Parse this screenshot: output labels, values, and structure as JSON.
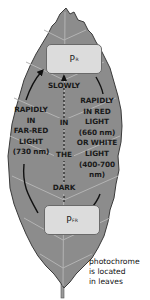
{
  "diagram": {
    "type": "phytochrome-cycle",
    "colors": {
      "leaf": "#8c8c8c",
      "leaf_edge": "#3a3a3a",
      "veins": "#b4b4b4",
      "box": "#dcdcdc",
      "arrow": "#111111"
    },
    "states": {
      "top": {
        "main": "P",
        "sub": "R"
      },
      "bottom": {
        "main": "P",
        "sub": "FR"
      }
    },
    "labels": {
      "left": [
        "RAPIDLY",
        "IN",
        "FAR-RED",
        "LIGHT",
        "(730 nm)"
      ],
      "center_top": "SLOWLY",
      "center": [
        "IN",
        "THE",
        "DARK"
      ],
      "right": [
        "RAPIDLY",
        "IN RED",
        "LIGHT",
        "(660 nm)",
        "OR WHITE",
        "LIGHT",
        "(400-700",
        "nm)"
      ]
    },
    "caption": [
      "photochrome",
      "is located",
      "in leaves"
    ]
  }
}
